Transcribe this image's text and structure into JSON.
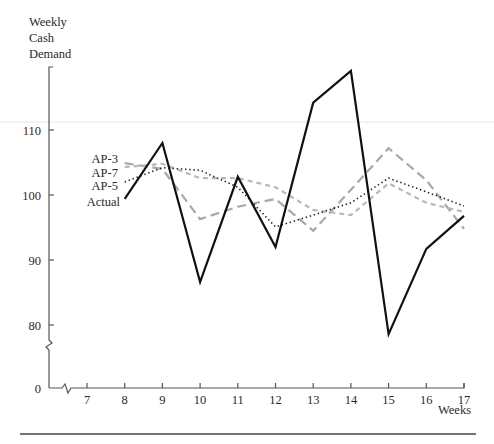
{
  "chart_data": {
    "type": "line",
    "title": "",
    "ylabel_lines": [
      "Weekly",
      "Cash",
      "Demand"
    ],
    "xlabel": "Weeks",
    "x": [
      7,
      8,
      9,
      10,
      11,
      12,
      13,
      14,
      15,
      16,
      17
    ],
    "y_ticks": [
      0,
      80,
      90,
      100,
      110
    ],
    "x_ticks": [
      7,
      8,
      9,
      10,
      11,
      12,
      13,
      14,
      15,
      16,
      17
    ],
    "axis_breaks": {
      "y": "between 0 and 80",
      "x": "between 0 and 7"
    },
    "ylim": [
      75,
      120
    ],
    "grid": false,
    "legend_position": "inline-left",
    "series": [
      {
        "name": "AP-3",
        "style": "long-dash",
        "color": "#a8a8a8",
        "x": [
          8,
          9,
          10,
          11,
          12,
          13,
          14,
          15,
          16,
          17
        ],
        "values": [
          104.9,
          104.0,
          96.3,
          98.2,
          99.4,
          94.5,
          100.8,
          107.2,
          102.3,
          94.8
        ]
      },
      {
        "name": "AP-7",
        "style": "short-dash",
        "color": "#b8b8b8",
        "x": [
          8,
          9,
          10,
          11,
          12,
          13,
          14,
          15,
          16,
          17
        ],
        "values": [
          104.3,
          104.8,
          102.6,
          102.6,
          101.2,
          97.7,
          96.9,
          101.8,
          98.8,
          97.4
        ]
      },
      {
        "name": "AP-5",
        "style": "dotted",
        "color": "#222222",
        "x": [
          8,
          9,
          10,
          11,
          12,
          13,
          14,
          15,
          16,
          17
        ],
        "values": [
          102.0,
          104.2,
          103.8,
          101.2,
          95.1,
          96.9,
          98.8,
          102.6,
          100.5,
          98.3
        ]
      },
      {
        "name": "Actual",
        "style": "solid",
        "color": "#111111",
        "x": [
          8,
          9,
          10,
          11,
          12,
          13,
          14,
          15,
          16,
          17
        ],
        "values": [
          99.4,
          108.0,
          86.6,
          102.8,
          92.0,
          114.2,
          119.1,
          78.6,
          91.7,
          96.8
        ]
      }
    ]
  }
}
